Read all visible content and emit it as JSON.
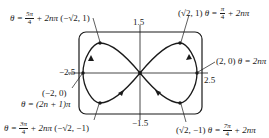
{
  "figure": {
    "type": "parametric curve plot (figure-eight) in viewing window",
    "window": {
      "x_min_label": "−2.5",
      "x_max_label": "2.5",
      "y_max_label": "1.5",
      "y_min_label": "−1.5"
    },
    "annotations": [
      {
        "id": "top-left",
        "theta_prefix": "θ =",
        "theta_num": "5π",
        "theta_den": "4",
        "theta_suffix": "+ 2nπ",
        "point": "(−√2, 1)"
      },
      {
        "id": "top-right",
        "point": "(√2, 1)",
        "theta_prefix": "θ =",
        "theta_num": "π",
        "theta_den": "4",
        "theta_suffix": "+ 2nπ"
      },
      {
        "id": "right",
        "point": "(2, 0)",
        "theta": "θ = 2nπ"
      },
      {
        "id": "left",
        "point": "(−2, 0)",
        "theta": "θ = (2n + 1)π"
      },
      {
        "id": "bottom-left",
        "theta_prefix": "θ =",
        "theta_num": "3π",
        "theta_den": "4",
        "theta_suffix": "+ 2nπ",
        "point": "(−√2, −1)"
      },
      {
        "id": "bottom-right",
        "point": "(√2, −1)",
        "theta_prefix": "θ =",
        "theta_num": "7π",
        "theta_den": "4",
        "theta_suffix": "+ 2nπ"
      }
    ],
    "curve_points": [
      {
        "x": 2,
        "y": 0
      },
      {
        "x": 1.414,
        "y": 1
      },
      {
        "x": 0,
        "y": 0
      },
      {
        "x": -1.414,
        "y": -1
      },
      {
        "x": -2,
        "y": 0
      },
      {
        "x": -1.414,
        "y": 1
      },
      {
        "x": 0,
        "y": 0
      },
      {
        "x": 1.414,
        "y": -1
      }
    ],
    "colors": {
      "stroke": "#1a1a1a",
      "background": "#ffffff"
    }
  }
}
